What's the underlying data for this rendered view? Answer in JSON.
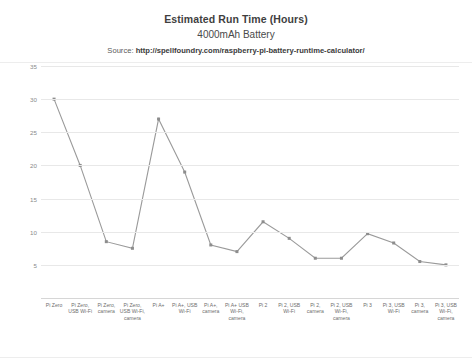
{
  "chart_data": {
    "type": "line",
    "title": "Estimated Run Time (Hours)",
    "subtitle": "4000mAh Battery",
    "source_label": "Source:",
    "source_url": "http://spellfoundry.com/raspberry-pi-battery-runtime-calculator/",
    "xlabel": "",
    "ylabel": "",
    "ylim": [
      0,
      35
    ],
    "yticks": [
      5,
      10,
      15,
      20,
      25,
      30,
      35
    ],
    "ytick_labels": [
      "5",
      "10",
      "15",
      "20",
      "25",
      "30",
      "35"
    ],
    "grid": true,
    "legend": "none",
    "series_color": "#9a9a9a",
    "marker_color": "#8d8d8d",
    "categories": [
      "Pi Zero",
      "Pi Zero, USB Wi-Fi",
      "Pi Zero, camera",
      "Pi Zero, USB Wi-Fi, camera",
      "Pi A+",
      "Pi A+, USB Wi-Fi",
      "Pi A+, camera",
      "Pi A+ USB Wi-Fi, camera",
      "Pi 2",
      "Pi 2, USB Wi-Fi",
      "Pi 2, camera",
      "Pi 2, USB Wi-Fi, camera",
      "Pi 3",
      "Pi 3, USB Wi-Fi",
      "Pi 3, camera",
      "Pi 3, USB Wi-Fi, camera"
    ],
    "values": [
      30,
      20,
      8.5,
      7.5,
      27,
      19,
      8,
      7,
      11.5,
      9,
      6,
      6,
      9.7,
      8.3,
      5.5,
      5
    ]
  }
}
